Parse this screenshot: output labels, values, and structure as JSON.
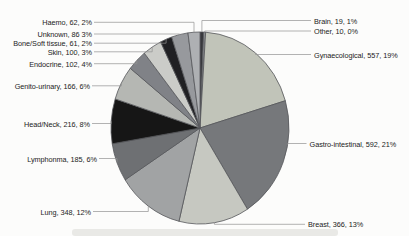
{
  "figure": {
    "title": "",
    "description_text": ""
  },
  "chart_data": {
    "type": "pie",
    "title": "",
    "total": 2870,
    "legend_position": "callout-labels",
    "layout": {
      "cx": 200,
      "cy": 128,
      "rx": 89,
      "ry": 96,
      "start_angle_deg": 0,
      "direction": "clockwise",
      "background": "#fcfcfb",
      "slice_stroke": "#56575a",
      "leader_color": "#929292",
      "label_color": "#232323"
    },
    "slices": [
      {
        "id": "brain",
        "name": "Brain",
        "value": 19,
        "percent": "1%",
        "label": "Brain, 19, 1%",
        "color": "#38393d",
        "side": "right",
        "lx": 314,
        "ly": 20.5
      },
      {
        "id": "other",
        "name": "Other",
        "value": 10,
        "percent": "0%",
        "label": "Other, 10, 0%",
        "color": "#8f9194",
        "side": "right",
        "lx": 314,
        "ly": 31
      },
      {
        "id": "gynaecological",
        "name": "Gynaecological",
        "value": 557,
        "percent": "19%",
        "label": "Gynaecological, 557, 19%",
        "color": "#c1c4b9",
        "side": "right",
        "lx": 314,
        "ly": 54.5
      },
      {
        "id": "gastro-intestinal",
        "name": "Gastro-intestinal",
        "value": 592,
        "percent": "21%",
        "label": "Gastro-intestinal, 592, 21%",
        "color": "#76787b",
        "side": "right",
        "lx": 309.5,
        "ly": 143.5,
        "attach_deg": 100
      },
      {
        "id": "breast",
        "name": "Breast",
        "value": 366,
        "percent": "13%",
        "label": "Breast, 366, 13%",
        "color": "#c6c8c1",
        "side": "right",
        "lx": 308,
        "ly": 224.3
      },
      {
        "id": "lung",
        "name": "Lung",
        "value": 348,
        "percent": "12%",
        "label": "Lung, 348, 12%",
        "color": "#a1a3a4",
        "side": "left",
        "lx": 91,
        "ly": 211.5
      },
      {
        "id": "lymphonma",
        "name": "Lymphonma",
        "value": 185,
        "percent": "6%",
        "label": "Lymphonma, 185, 6%",
        "color": "#6e7073",
        "side": "left",
        "lx": 97,
        "ly": 158.5
      },
      {
        "id": "head-neck",
        "name": "Head/Neck",
        "value": 216,
        "percent": "8%",
        "label": "Head/Neck, 216, 8%",
        "color": "#161616",
        "side": "left",
        "lx": 90,
        "ly": 123.5
      },
      {
        "id": "genito-urinary",
        "name": "Genito-urinary",
        "value": 166,
        "percent": "6%",
        "label": "Genito-urinary, 166, 6%",
        "color": "#b5b7b3",
        "side": "left",
        "lx": 90,
        "ly": 85.8
      },
      {
        "id": "endocrine",
        "name": "Endocrine",
        "value": 102,
        "percent": "4%",
        "label": "Endocrine, 102, 4%",
        "color": "#808287",
        "side": "left",
        "lx": 92,
        "ly": 63.7
      },
      {
        "id": "skin",
        "name": "Skin",
        "value": 100,
        "percent": "3%",
        "label": "Skin, 100, 3%",
        "color": "#cbccc8",
        "side": "left",
        "lx": 92,
        "ly": 51.8
      },
      {
        "id": "bone-soft-tissue",
        "name": "Bone/Soft tissue",
        "value": 61,
        "percent": "2%",
        "label": "Bone/Soft tissue, 61, 2%",
        "color": "#202023",
        "side": "left",
        "lx": 92,
        "ly": 43.2
      },
      {
        "id": "unknown",
        "name": "Unknown",
        "value": 86,
        "percent": "3%",
        "label": "Unknown, 86 3%",
        "color": "#97999d",
        "side": "left",
        "lx": 92,
        "ly": 34
      },
      {
        "id": "haemo",
        "name": "Haemo",
        "value": 62,
        "percent": "2%",
        "label": "Haemo, 62, 2%",
        "color": "#aeb0b3",
        "side": "left",
        "lx": 92,
        "ly": 22.3
      }
    ]
  }
}
